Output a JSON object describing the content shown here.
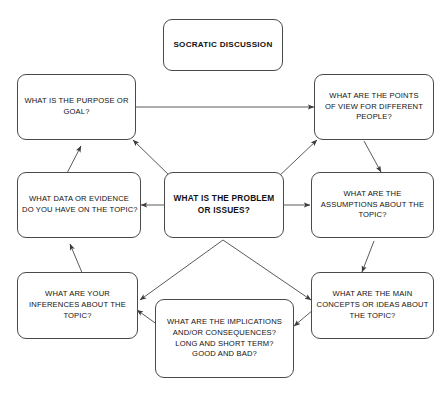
{
  "diagram": {
    "title": "SOCRATIC DISCUSSION",
    "stroke_color": "#4a4a4a",
    "text_color": "#111111",
    "background_color": "#ffffff",
    "nodes": [
      {
        "id": "title",
        "name": "socratic-discussion-title-box",
        "lines": [
          "SOCRATIC DISCUSSION"
        ],
        "bold": true
      },
      {
        "id": "purpose",
        "name": "purpose-or-goal-box",
        "lines": [
          "WHAT IS THE PURPOSE OR",
          "GOAL?"
        ],
        "bold": false
      },
      {
        "id": "points_of_view",
        "name": "points-of-view-box",
        "lines": [
          "WHAT ARE THE POINTS",
          "OF VIEW FOR DIFFERENT",
          "PEOPLE?"
        ],
        "bold": false
      },
      {
        "id": "data",
        "name": "data-or-evidence-box",
        "lines": [
          "WHAT DATA OR EVIDENCE",
          "DO YOU HAVE ON THE TOPIC?"
        ],
        "bold": false
      },
      {
        "id": "center",
        "name": "problem-or-issues-center-box",
        "lines": [
          "WHAT IS THE PROBLEM",
          "OR ISSUES?"
        ],
        "bold": true
      },
      {
        "id": "assumptions",
        "name": "assumptions-box",
        "lines": [
          "WHAT ARE THE",
          "ASSUMPTIONS ABOUT THE",
          "TOPIC?"
        ],
        "bold": false
      },
      {
        "id": "inferences",
        "name": "inferences-box",
        "lines": [
          "WHAT ARE YOUR",
          "INFERENCES ABOUT THE",
          "TOPIC?"
        ],
        "bold": false
      },
      {
        "id": "implications",
        "name": "implications-box",
        "lines": [
          "WHAT ARE THE IMPLICATIONS",
          "AND/OR CONSEQUENCES?",
          "LONG AND SHORT TERM?",
          "GOOD AND BAD?"
        ],
        "bold": false
      },
      {
        "id": "concepts",
        "name": "main-concepts-box",
        "lines": [
          "WHAT ARE THE MAIN",
          "CONCEPTS OR IDEAS ABOUT",
          "THE TOPIC?"
        ],
        "bold": false
      }
    ],
    "edges": [
      {
        "name": "edge-purpose-points-of-view",
        "from": "purpose",
        "to": "points_of_view",
        "style": "double-headed"
      },
      {
        "name": "edge-center-purpose",
        "from": "center",
        "to": "purpose",
        "style": "single-headed"
      },
      {
        "name": "edge-center-points-of-view",
        "from": "center",
        "to": "points_of_view",
        "style": "single-headed"
      },
      {
        "name": "edge-center-data",
        "from": "center",
        "to": "data",
        "style": "single-headed"
      },
      {
        "name": "edge-center-assumptions",
        "from": "center",
        "to": "assumptions",
        "style": "single-headed"
      },
      {
        "name": "edge-center-inferences",
        "from": "center",
        "to": "inferences",
        "style": "single-headed"
      },
      {
        "name": "edge-center-concepts",
        "from": "center",
        "to": "concepts",
        "style": "single-headed"
      },
      {
        "name": "edge-data-purpose",
        "from": "data",
        "to": "purpose",
        "style": "single-headed"
      },
      {
        "name": "edge-inferences-data",
        "from": "inferences",
        "to": "data",
        "style": "single-headed"
      },
      {
        "name": "edge-implications-inferences",
        "from": "implications",
        "to": "inferences",
        "style": "single-headed"
      },
      {
        "name": "edge-points-of-view-assumptions",
        "from": "points_of_view",
        "to": "assumptions",
        "style": "single-headed"
      },
      {
        "name": "edge-assumptions-concepts",
        "from": "assumptions",
        "to": "concepts",
        "style": "single-headed"
      },
      {
        "name": "edge-concepts-implications",
        "from": "concepts",
        "to": "implications",
        "style": "single-headed"
      }
    ]
  }
}
